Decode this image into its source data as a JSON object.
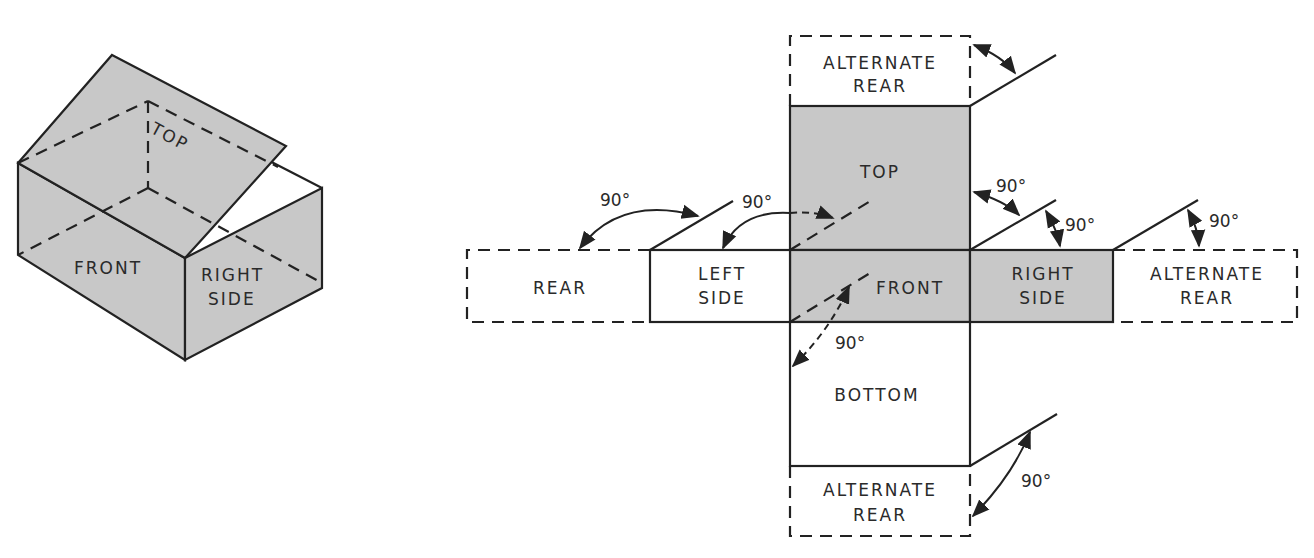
{
  "colors": {
    "shaded_panel": "#c8c8c8",
    "line": "#222222",
    "background": "#ffffff"
  },
  "isometric_box": {
    "labels": {
      "top": "TOP",
      "front": "FRONT",
      "right_side_line1": "RIGHT",
      "right_side_line2": "SIDE"
    }
  },
  "net": {
    "panels": {
      "alternate_rear_top": {
        "line1": "ALTERNATE",
        "line2": "REAR"
      },
      "top": {
        "line1": "TOP"
      },
      "rear": {
        "line1": "REAR"
      },
      "left_side": {
        "line1": "LEFT",
        "line2": "SIDE"
      },
      "front": {
        "line1": "FRONT"
      },
      "right_side": {
        "line1": "RIGHT",
        "line2": "SIDE"
      },
      "alternate_rear_right": {
        "line1": "ALTERNATE",
        "line2": "REAR"
      },
      "bottom": {
        "line1": "BOTTOM"
      },
      "alternate_rear_bottom": {
        "line1": "ALTERNATE",
        "line2": "REAR"
      }
    },
    "angles": {
      "rear_fold": "90°",
      "left_side_fold": "90°",
      "top_to_right": "90°",
      "right_side_fold": "90°",
      "alt_rear_right_fold": "90°",
      "front_bottom_fold": "90°",
      "alt_rear_bottom_fold": "90°"
    }
  }
}
